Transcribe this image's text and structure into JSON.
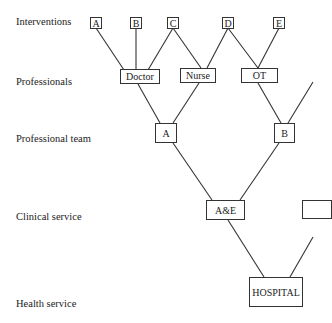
{
  "levels": [
    {
      "label": "Interventions"
    },
    {
      "label": "Professionals"
    },
    {
      "label": "Professional team"
    },
    {
      "label": "Clinical service"
    },
    {
      "label": "Health service"
    }
  ],
  "interventions": [
    "A",
    "B",
    "C",
    "D",
    "E"
  ],
  "professionals": [
    "Doctor",
    "Nurse",
    "OT"
  ],
  "teams": [
    "A",
    "B"
  ],
  "clinical_services": [
    "A&E",
    ""
  ],
  "health_service": "HOSPITAL"
}
